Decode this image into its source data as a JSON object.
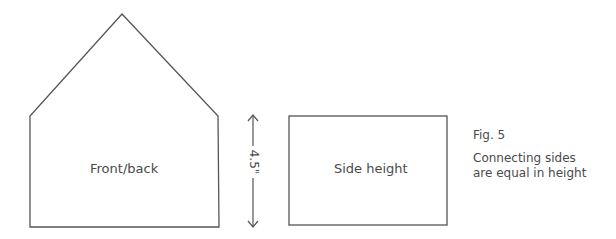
{
  "diagram": {
    "shapes": [
      {
        "id": "front-back",
        "type": "house-pentagon",
        "label": "Front/back"
      },
      {
        "id": "side",
        "type": "rectangle",
        "label": "Side height"
      }
    ],
    "dimension": {
      "label": "4.5\"",
      "orientation": "vertical"
    },
    "caption": {
      "figure": "Fig. 5",
      "text": "Connecting sides are equal in height"
    },
    "colors": {
      "stroke": "#555555",
      "text": "#4a4a4a",
      "background": "#ffffff"
    }
  }
}
